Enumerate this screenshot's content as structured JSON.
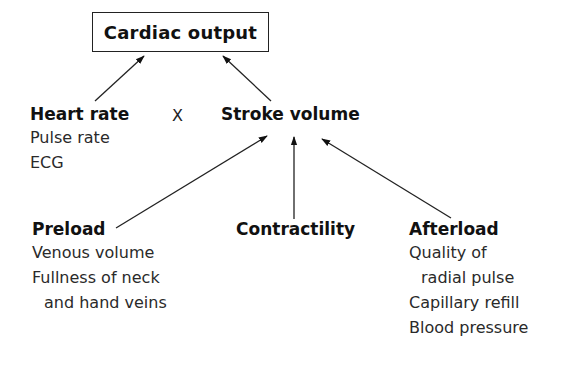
{
  "diagram": {
    "root": {
      "label": "Cardiac output"
    },
    "level1": {
      "heart_rate": {
        "label": "Heart rate",
        "indicators": [
          "Pulse rate",
          "ECG"
        ]
      },
      "operator": "X",
      "stroke_volume": {
        "label": "Stroke volume"
      }
    },
    "level2": {
      "preload": {
        "label": "Preload",
        "indicators": [
          "Venous volume",
          "Fullness of neck",
          "and hand veins"
        ]
      },
      "contractility": {
        "label": "Contractility"
      },
      "afterload": {
        "label": "Afterload",
        "indicators": [
          "Quality of",
          "radial pulse",
          "Capillary refill",
          "Blood pressure"
        ]
      }
    },
    "edges": [
      {
        "from": "Heart rate",
        "to": "Cardiac output"
      },
      {
        "from": "Stroke volume",
        "to": "Cardiac output"
      },
      {
        "from": "Preload",
        "to": "Stroke volume"
      },
      {
        "from": "Contractility",
        "to": "Stroke volume"
      },
      {
        "from": "Afterload",
        "to": "Stroke volume"
      }
    ],
    "colors": {
      "ink": "#111111",
      "background": "#ffffff"
    }
  }
}
